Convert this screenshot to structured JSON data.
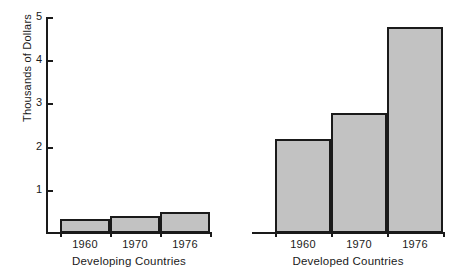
{
  "chart_data": {
    "type": "bar",
    "title": "",
    "xlabel": "",
    "ylabel": "Thousands of Dollars",
    "ylim": [
      0,
      5
    ],
    "yticks": [
      1,
      2,
      3,
      4,
      5
    ],
    "ytick_labels": [
      "1",
      "2",
      "3",
      "4",
      "5"
    ],
    "grid": false,
    "legend": null,
    "categories": [
      "1960",
      "1970",
      "1976"
    ],
    "groups": [
      {
        "name": "Developing Countries",
        "categories": [
          "1960",
          "1970",
          "1976"
        ],
        "values": [
          0.32,
          0.39,
          0.49
        ]
      },
      {
        "name": "Developed Countries",
        "categories": [
          "1960",
          "1970",
          "1976"
        ],
        "values": [
          2.18,
          2.78,
          4.77
        ]
      }
    ],
    "series": [
      {
        "name": "Developing Countries",
        "values": [
          0.32,
          0.39,
          0.49
        ]
      },
      {
        "name": "Developed Countries",
        "values": [
          2.18,
          2.78,
          4.77
        ]
      }
    ],
    "bar_fill_color": "#c2c2c2",
    "bar_edge_color": "#1a1a1a",
    "background_color": "#ffffff"
  },
  "axis": {
    "y_label": "Thousands of Dollars",
    "y_ticks": [
      {
        "label": "5",
        "value": 5
      },
      {
        "label": "4",
        "value": 4
      },
      {
        "label": "3",
        "value": 3
      },
      {
        "label": "2",
        "value": 2
      },
      {
        "label": "1",
        "value": 1
      }
    ]
  },
  "panels": [
    {
      "caption": "Developing Countries",
      "bars": [
        {
          "label": "1960",
          "value": 0.32
        },
        {
          "label": "1970",
          "value": 0.39
        },
        {
          "label": "1976",
          "value": 0.49
        }
      ]
    },
    {
      "caption": "Developed Countries",
      "bars": [
        {
          "label": "1960",
          "value": 2.18
        },
        {
          "label": "1970",
          "value": 2.78
        },
        {
          "label": "1976",
          "value": 4.77
        }
      ]
    }
  ]
}
